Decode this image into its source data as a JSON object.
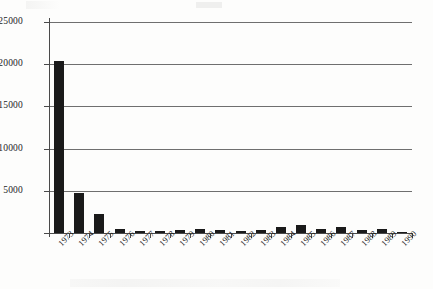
{
  "chart_data": {
    "type": "bar",
    "title": "",
    "subtitle": "",
    "xlabel": "",
    "ylabel": "",
    "categories": [
      "1973",
      "1974",
      "1975",
      "1976",
      "1977",
      "1978",
      "1979",
      "1980",
      "1981",
      "1982",
      "1983",
      "1984",
      "1985",
      "1986",
      "1987",
      "1988",
      "1989",
      "1990"
    ],
    "values": [
      20400,
      4700,
      2200,
      420,
      260,
      250,
      300,
      420,
      300,
      230,
      330,
      680,
      900,
      480,
      700,
      320,
      420,
      120
    ],
    "series": [
      {
        "name": "",
        "values": [
          20400,
          4700,
          2200,
          420,
          260,
          250,
          300,
          420,
          300,
          230,
          330,
          680,
          900,
          480,
          700,
          320,
          420,
          120
        ]
      }
    ],
    "ylim": [
      0,
      25000
    ],
    "yticks": [
      0,
      5000,
      10000,
      15000,
      20000,
      25000
    ],
    "ytick_labels": [
      "",
      "5000",
      "10000",
      "15000",
      "20000",
      "25000"
    ],
    "grid": true,
    "grid_axis": "y",
    "legend": null,
    "legend_position": "none",
    "bar_color": "#1a1a1a",
    "axis_color": "#4a4a4a",
    "grid_color": "#6f6f6f",
    "background_color": "#fdfdfc",
    "xtick_rotation": -45,
    "annotations": []
  }
}
